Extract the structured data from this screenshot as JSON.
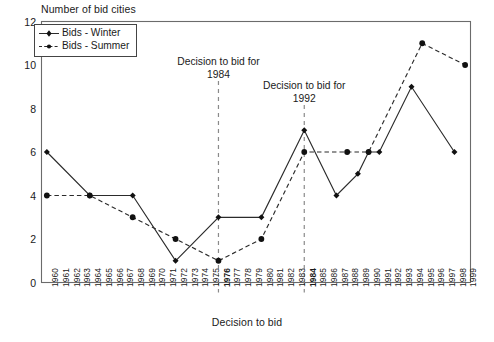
{
  "chart_data": {
    "type": "line",
    "title": "",
    "ylabel": "Number of bid cities",
    "xlabel": "Decision to bid",
    "ylim": [
      0,
      12
    ],
    "yticks": [
      0,
      2,
      4,
      6,
      8,
      10,
      12
    ],
    "grid": false,
    "legend_position": "top-left",
    "categories": [
      "1960",
      "1961",
      "1962",
      "1963",
      "1964",
      "1965",
      "1966",
      "1967",
      "1968",
      "1969",
      "1970",
      "1971",
      "1972",
      "1973",
      "1974",
      "1975",
      "1976",
      "1977",
      "1978",
      "1979",
      "1980",
      "1981",
      "1982",
      "1983",
      "1984",
      "1985",
      "1986",
      "1987",
      "1988",
      "1989",
      "1990",
      "1991",
      "1992",
      "1993",
      "1994",
      "1995",
      "1996",
      "1997",
      "1998",
      "1999"
    ],
    "bold_categories": [
      "1976",
      "1984"
    ],
    "series": [
      {
        "name": "Bids - Winter",
        "style": "solid",
        "marker": "diamond",
        "points": [
          {
            "x": "1960",
            "y": 6
          },
          {
            "x": "1964",
            "y": 4
          },
          {
            "x": "1968",
            "y": 4
          },
          {
            "x": "1972",
            "y": 1
          },
          {
            "x": "1976",
            "y": 3
          },
          {
            "x": "1980",
            "y": 3
          },
          {
            "x": "1984",
            "y": 7
          },
          {
            "x": "1987",
            "y": 4
          },
          {
            "x": "1989",
            "y": 5
          },
          {
            "x": "1990",
            "y": 6
          },
          {
            "x": "1991",
            "y": 6
          },
          {
            "x": "1994",
            "y": 9
          },
          {
            "x": "1998",
            "y": 6
          }
        ]
      },
      {
        "name": "Bids - Summer",
        "style": "dashed",
        "marker": "circle",
        "points": [
          {
            "x": "1960",
            "y": 4
          },
          {
            "x": "1964",
            "y": 4
          },
          {
            "x": "1968",
            "y": 3
          },
          {
            "x": "1972",
            "y": 2
          },
          {
            "x": "1976",
            "y": 1
          },
          {
            "x": "1980",
            "y": 2
          },
          {
            "x": "1984",
            "y": 6
          },
          {
            "x": "1988",
            "y": 6
          },
          {
            "x": "1990",
            "y": 6
          },
          {
            "x": "1995",
            "y": 11
          },
          {
            "x": "1999",
            "y": 10
          }
        ]
      }
    ],
    "annotations": [
      {
        "id": "annot-1984",
        "line1": "Decision to bid for",
        "line2": "1984",
        "at_category": "1976"
      },
      {
        "id": "annot-1992",
        "line1": "Decision to bid for",
        "line2": "1992",
        "at_category": "1984"
      }
    ]
  },
  "legend": {
    "items": [
      {
        "label": "Bids - Winter"
      },
      {
        "label": "Bids - Summer"
      }
    ]
  },
  "colors": {
    "line": "#2b2b2b",
    "axis": "#6b6b6b",
    "text": "#1a1a1a"
  }
}
